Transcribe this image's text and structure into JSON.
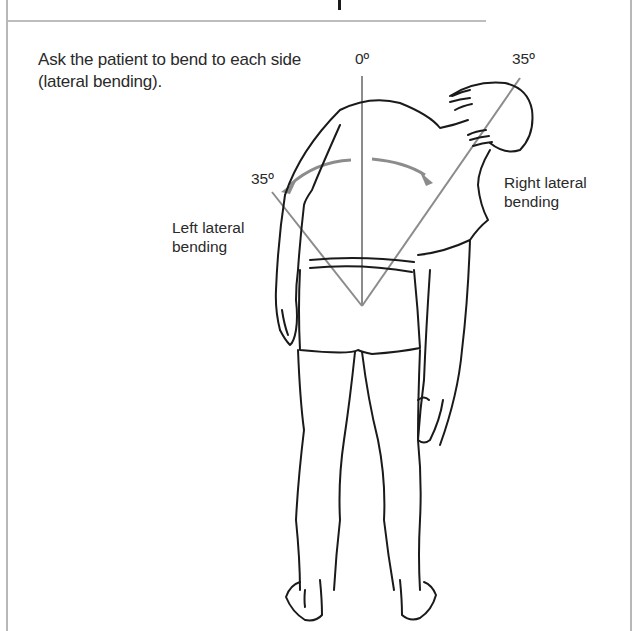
{
  "page": {
    "instruction": "Ask the patient to bend to each side (lateral bending)."
  },
  "figure": {
    "angle_labels": {
      "vertical": "0º",
      "right": "35º",
      "left": "35º"
    },
    "direction_labels": {
      "left": "Left lateral bending",
      "right": "Right lateral bending"
    },
    "colors": {
      "line_art": "#1a1a1a",
      "angle_lines": "#8c8c8c",
      "arrows": "#8c8c8c",
      "frame": "#b8b8b8"
    }
  }
}
